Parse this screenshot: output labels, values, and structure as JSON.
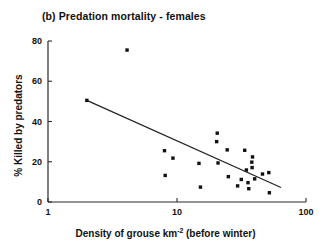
{
  "chart_data": {
    "type": "scatter",
    "title": "(b) Predation mortality - females",
    "xlabel": "Density of grouse km",
    "xlabel_sup": "-2",
    "xlabel_suffix": " (before winter)",
    "ylabel": "% Killed by predators",
    "xscale": "log",
    "xlim": [
      1,
      100
    ],
    "ylim": [
      0,
      80
    ],
    "xticks": [
      1,
      10,
      100
    ],
    "xtick_labels": [
      "1",
      "10",
      "100"
    ],
    "yticks": [
      0,
      20,
      40,
      60,
      80
    ],
    "ytick_labels": [
      "0",
      "20",
      "40",
      "60",
      "80"
    ],
    "grid": false,
    "legend": "none",
    "series": [
      {
        "name": "Predation mortality (females)",
        "marker": "square",
        "color": "#111111",
        "points": [
          {
            "x": 2.0,
            "y": 50.5
          },
          {
            "x": 4.1,
            "y": 75.5
          },
          {
            "x": 8.0,
            "y": 25.5
          },
          {
            "x": 8.1,
            "y": 13.2
          },
          {
            "x": 9.3,
            "y": 21.8
          },
          {
            "x": 14.8,
            "y": 19.2
          },
          {
            "x": 15.2,
            "y": 7.4
          },
          {
            "x": 20.5,
            "y": 34.2
          },
          {
            "x": 20.3,
            "y": 30.0
          },
          {
            "x": 20.8,
            "y": 19.4
          },
          {
            "x": 24.5,
            "y": 25.9
          },
          {
            "x": 25.0,
            "y": 12.6
          },
          {
            "x": 29.5,
            "y": 8.0
          },
          {
            "x": 33.5,
            "y": 25.7
          },
          {
            "x": 34.5,
            "y": 15.9
          },
          {
            "x": 35.5,
            "y": 9.6
          },
          {
            "x": 36.0,
            "y": 6.6
          },
          {
            "x": 38.5,
            "y": 22.4
          },
          {
            "x": 38.0,
            "y": 19.8
          },
          {
            "x": 38.2,
            "y": 17.1
          },
          {
            "x": 40.0,
            "y": 11.5
          },
          {
            "x": 31.5,
            "y": 11.2
          },
          {
            "x": 46.0,
            "y": 13.9
          },
          {
            "x": 51.5,
            "y": 14.6
          },
          {
            "x": 52.0,
            "y": 4.6
          }
        ]
      }
    ],
    "fit_line": {
      "name": "regression-line",
      "x_start": 2.0,
      "y_start": 50.5,
      "x_end": 64.0,
      "y_end": 7.2
    }
  }
}
